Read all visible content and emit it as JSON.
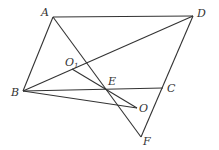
{
  "figure": {
    "width": 219,
    "height": 150,
    "line_color": "#333333",
    "background": "#ffffff",
    "points": {
      "A": {
        "label": "A",
        "x": 53,
        "y": 17,
        "lx": 41,
        "ly": 16
      },
      "D": {
        "label": "D",
        "x": 193,
        "y": 16,
        "lx": 197,
        "ly": 17
      },
      "B": {
        "label": "B",
        "x": 23,
        "y": 91,
        "lx": 11,
        "ly": 96
      },
      "C": {
        "label": "C",
        "x": 163,
        "y": 88,
        "lx": 167,
        "ly": 92
      },
      "E": {
        "label": "E",
        "x": 107,
        "y": 89,
        "lx": 108,
        "ly": 85
      },
      "O": {
        "label": "O",
        "x": 137,
        "y": 108,
        "lx": 139,
        "ly": 112
      },
      "F": {
        "label": "F",
        "x": 141,
        "y": 137,
        "lx": 143,
        "ly": 145
      },
      "O1": {
        "label": "O",
        "sub": "1",
        "x": 72,
        "y": 69,
        "lx": 65,
        "ly": 66
      }
    },
    "segments": [
      {
        "name": "AD",
        "from": "A",
        "to": "D"
      },
      {
        "name": "AB",
        "from": "A",
        "to": "B"
      },
      {
        "name": "BC",
        "from": "B",
        "to": "C"
      },
      {
        "name": "DF",
        "from": "D",
        "to": "F"
      },
      {
        "name": "AF",
        "from": "A",
        "to": "F"
      },
      {
        "name": "BD",
        "from": "B",
        "to": "D"
      },
      {
        "name": "BO",
        "from": "B",
        "to": "O"
      },
      {
        "name": "O1O",
        "from": "O1",
        "to": "O"
      }
    ]
  }
}
